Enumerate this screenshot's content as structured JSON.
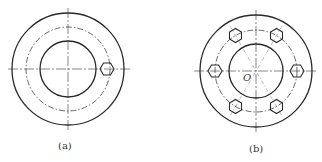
{
  "figures": [
    {
      "id": "a",
      "label": "(a)",
      "center": [
        68,
        69
      ],
      "outer_r": 56,
      "pitch_r": 42,
      "inner_r": 28,
      "bolt_count": 1
    },
    {
      "id": "b",
      "label": "(b)",
      "center": [
        256,
        71
      ],
      "outer_r": 56,
      "pitch_r": 41,
      "inner_r": 27,
      "bolt_count": 6,
      "center_label": "O"
    }
  ],
  "colors": {
    "line": "#2a2a2a",
    "center_line": "#555555",
    "background": "#ffffff"
  }
}
